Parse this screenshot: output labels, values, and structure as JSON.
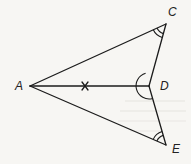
{
  "diagram": {
    "type": "geometry-figure",
    "points": [
      {
        "id": "A",
        "label": "A",
        "x": 30,
        "y": 86,
        "label_x": 15,
        "label_y": 90
      },
      {
        "id": "C",
        "label": "C",
        "x": 166,
        "y": 24,
        "label_x": 168,
        "label_y": 16
      },
      {
        "id": "D",
        "label": "D",
        "x": 149,
        "y": 86,
        "label_x": 160,
        "label_y": 90
      },
      {
        "id": "E",
        "label": "E",
        "x": 166,
        "y": 145,
        "label_x": 172,
        "label_y": 153
      }
    ],
    "segments": [
      {
        "from": "A",
        "to": "C"
      },
      {
        "from": "A",
        "to": "D"
      },
      {
        "from": "A",
        "to": "E"
      },
      {
        "from": "C",
        "to": "D"
      },
      {
        "from": "D",
        "to": "E"
      }
    ],
    "marks": [
      {
        "type": "cross",
        "on_segment": "AD",
        "x": 85,
        "y": 86
      },
      {
        "type": "double-arc",
        "vertex": "C",
        "angle": "ACD"
      },
      {
        "type": "double-arc",
        "vertex": "E",
        "angle": "AED"
      },
      {
        "type": "single-arc",
        "vertex": "D",
        "angle": "CDE (facing A)"
      }
    ],
    "colors": {
      "line": "#1c1c1c",
      "background": "#f7f6f3"
    }
  }
}
